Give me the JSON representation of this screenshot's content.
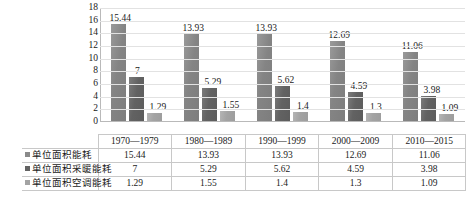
{
  "chart_data": {
    "type": "bar",
    "title": "",
    "subtitle": "",
    "xlabel": "",
    "ylabel": "",
    "ylim": [
      0,
      18
    ],
    "yticks": [
      18,
      16,
      14,
      12,
      10,
      8,
      6,
      4,
      2,
      0
    ],
    "grid": true,
    "legend_position": "table-left",
    "categories": [
      "1970—1979",
      "1980—1989",
      "1990—1999",
      "2000—2009",
      "2010—2015"
    ],
    "series": [
      {
        "name": "单位面积能耗",
        "color": "#8a8a8a",
        "values": [
          15.44,
          13.93,
          13.93,
          12.69,
          11.06
        ],
        "labels": [
          "15.44",
          "13.93",
          "13.93",
          "12.69",
          "11.06"
        ]
      },
      {
        "name": "单位面积采暖能耗",
        "color": "#636363",
        "values": [
          7,
          5.29,
          5.62,
          4.59,
          3.98
        ],
        "labels": [
          "7",
          "5.29",
          "5.62",
          "4.59",
          "3.98"
        ]
      },
      {
        "name": "单位面积空调能耗",
        "color": "#a3a3a3",
        "values": [
          1.29,
          1.55,
          1.4,
          1.3,
          1.09
        ],
        "labels": [
          "1.29",
          "1.55",
          "1.4",
          "1.3",
          "1.09"
        ]
      }
    ]
  }
}
